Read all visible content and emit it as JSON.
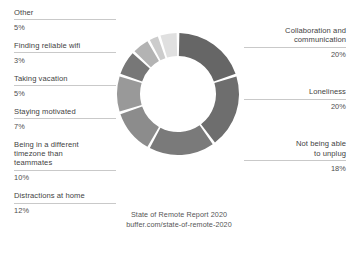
{
  "chart_data": {
    "type": "pie",
    "title": "State of Remote Report 2020",
    "subtitle": "buffer.com/state-of-remote-2020",
    "xlabel": "",
    "ylabel": "",
    "legend_position": "outside-left-right",
    "grid": false,
    "donut": true,
    "categories": [
      "Collaboration and communication",
      "Loneliness",
      "Not being able to unplug",
      "Distractions at home",
      "Being in a different timezone than teammates",
      "Staying motivated",
      "Taking vacation",
      "Finding reliable wifi",
      "Other"
    ],
    "values": [
      20,
      20,
      18,
      12,
      10,
      7,
      5,
      3,
      5
    ],
    "value_labels": [
      "20%",
      "20%",
      "18%",
      "12%",
      "10%",
      "7%",
      "5%",
      "3%",
      "5%"
    ],
    "colors": [
      "#666666",
      "#6e6e6e",
      "#7a7a7a",
      "#8c8c8c",
      "#999999",
      "#777777",
      "#b3b3b3",
      "#cccccc",
      "#e0e0e0"
    ],
    "total": 100
  },
  "labels_left": [
    {
      "title": "Other",
      "pct": "5%"
    },
    {
      "title": "Finding reliable wifi",
      "pct": "3%"
    },
    {
      "title": "Taking vacation",
      "pct": "5%"
    },
    {
      "title": "Staying motivated",
      "pct": "7%"
    },
    {
      "title": "Being in a different\ntimezone than\nteammates",
      "pct": "10%"
    },
    {
      "title": "Distractions at home",
      "pct": "12%"
    }
  ],
  "labels_right": [
    {
      "title": "Collaboration and\ncommunication",
      "pct": "20%"
    },
    {
      "title": "Loneliness",
      "pct": "20%"
    },
    {
      "title": "Not being able\nto unplug",
      "pct": "18%"
    }
  ],
  "caption": {
    "line1": "State of Remote Report 2020",
    "line2": "buffer.com/state-of-remote-2020"
  }
}
